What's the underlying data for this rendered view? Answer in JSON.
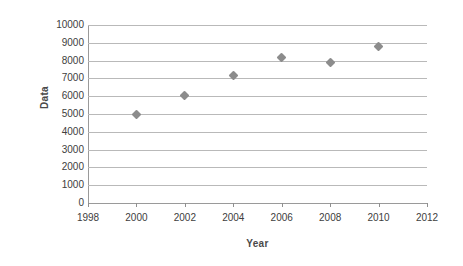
{
  "chart_data": {
    "type": "scatter",
    "title": "",
    "xlabel": "Year",
    "ylabel": "Data",
    "xlim": [
      1998,
      2012
    ],
    "ylim": [
      0,
      10000
    ],
    "xticks": [
      1998,
      2000,
      2002,
      2004,
      2006,
      2008,
      2010,
      2012
    ],
    "yticks": [
      0,
      1000,
      2000,
      3000,
      4000,
      5000,
      6000,
      7000,
      8000,
      9000,
      10000
    ],
    "xtick_labels": [
      "1998",
      "2000",
      "2002",
      "2004",
      "2006",
      "2008",
      "2010",
      "2012"
    ],
    "ytick_labels": [
      "0",
      "1000",
      "2000",
      "3000",
      "4000",
      "5000",
      "6000",
      "7000",
      "8000",
      "9000",
      "10000"
    ],
    "grid": "horizontal",
    "legend": "none",
    "marker": "diamond",
    "marker_color": "#8c8c8c",
    "gridline_color": "#b9b9b9",
    "axis_color": "#9a9a9a",
    "background_color": "#ffffff",
    "x": [
      2000,
      2002,
      2004,
      2006,
      2008,
      2010
    ],
    "values": [
      4950,
      6050,
      7150,
      8200,
      7900,
      8800
    ],
    "points": [
      {
        "x": 2000,
        "y": 4950
      },
      {
        "x": 2002,
        "y": 6050
      },
      {
        "x": 2004,
        "y": 7150
      },
      {
        "x": 2006,
        "y": 8200
      },
      {
        "x": 2008,
        "y": 7900
      },
      {
        "x": 2010,
        "y": 8800
      }
    ]
  }
}
